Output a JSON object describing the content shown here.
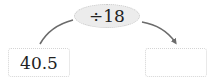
{
  "diagram": {
    "operation": {
      "label": "÷18",
      "operator": "÷",
      "operand": "18"
    },
    "input_box": {
      "value": "40.5"
    },
    "output_box": {
      "value": ""
    },
    "colors": {
      "arrow": "#6b6b6b",
      "oval_fill": "#ececec",
      "oval_border": "#c8c8c8",
      "box_border": "#d4d4d4",
      "text": "#222222"
    }
  }
}
